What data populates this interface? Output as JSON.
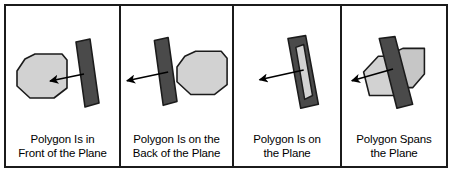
{
  "figure": {
    "border_color": "#1b1b1b",
    "background": "#ffffff",
    "polygon_fill": "#d2d2d2",
    "polygon_stroke": "#1b1b1b",
    "plane_fill": "#4a4a4a",
    "plane_stroke": "#1b1b1b",
    "arrow_color": "#000000"
  },
  "panels": [
    {
      "id": "front-of-plane",
      "caption_line1": "Polygon Is in",
      "caption_line2": "Front of the Plane",
      "polygon_name": "polygon-shape",
      "plane_name": "plane-slab",
      "arrow_name": "normal-arrow"
    },
    {
      "id": "back-of-plane",
      "caption_line1": "Polygon Is on the",
      "caption_line2": "Back of the Plane",
      "polygon_name": "polygon-shape",
      "plane_name": "plane-slab",
      "arrow_name": "normal-arrow"
    },
    {
      "id": "on-plane",
      "caption_line1": "Polygon Is on",
      "caption_line2": "the Plane",
      "polygon_name": "polygon-shape",
      "plane_name": "plane-slab",
      "arrow_name": "normal-arrow"
    },
    {
      "id": "spans-plane",
      "caption_line1": "Polygon Spans",
      "caption_line2": "the Plane",
      "polygon_name": "polygon-shape",
      "plane_name": "plane-slab",
      "arrow_name": "normal-arrow"
    }
  ]
}
